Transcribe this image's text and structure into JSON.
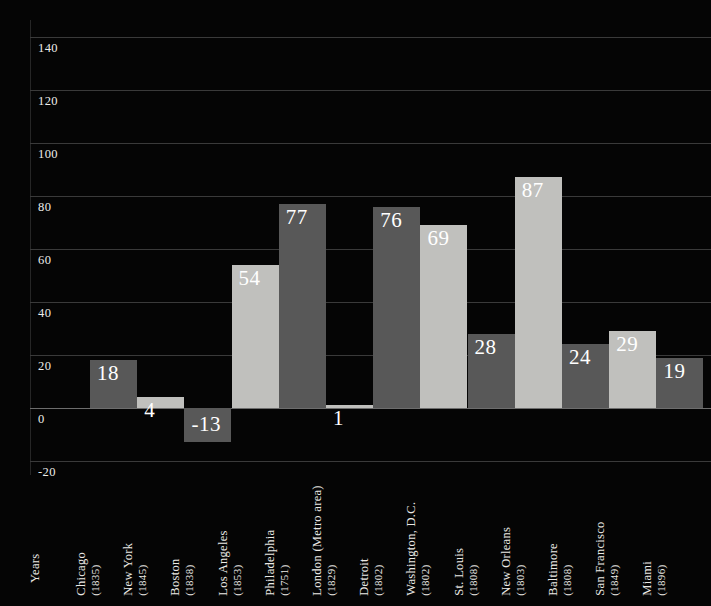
{
  "chart_data": {
    "type": "bar",
    "title": "",
    "subtitle": "",
    "xlabel": "Years",
    "ylabel": "",
    "ylim": [
      -20,
      140
    ],
    "ytick_step": 20,
    "yticks": [
      "140",
      "120",
      "100",
      "80",
      "60",
      "40",
      "20",
      "0",
      "-20"
    ],
    "grid": true,
    "legend_position": "none",
    "categories": [
      "Chicago",
      "New York",
      "Boston",
      "Los Angeles",
      "Philadelphia",
      "London (Metro area)",
      "Detroit",
      "Washington, D.C.",
      "St. Louis",
      "New Orleans",
      "Baltimore",
      "San Francisco",
      "Miami"
    ],
    "category_years": [
      "(1835)",
      "(1845)",
      "(1838)",
      "(1853)",
      "(1751)",
      "(1829)",
      "(1802)",
      "(1802)",
      "(1808)",
      "(1803)",
      "(1808)",
      "(1849)",
      "(1896)"
    ],
    "values": [
      18,
      4,
      -13,
      54,
      77,
      1,
      76,
      69,
      28,
      87,
      24,
      29,
      19
    ],
    "value_labels": [
      "18",
      "4",
      "-13",
      "54",
      "77",
      "1",
      "76",
      "69",
      "28",
      "87",
      "24",
      "29",
      "19"
    ],
    "bar_styles": [
      "dark",
      "light",
      "dark",
      "light",
      "dark",
      "light",
      "dark",
      "light",
      "dark",
      "light",
      "dark",
      "light",
      "dark"
    ],
    "colors": {
      "background": "#050505",
      "bar_dark": "#585858",
      "bar_light": "#c0c0bd",
      "gridline": "#3a3a3a",
      "zero_line": "#6d6d6d",
      "text": "#efeeeb",
      "value_label": "#ffffff"
    }
  }
}
